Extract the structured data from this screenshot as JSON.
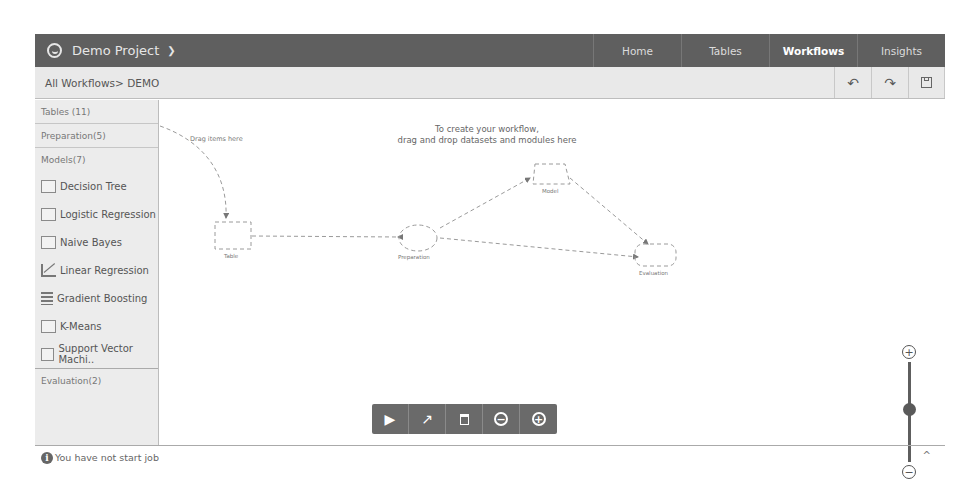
{
  "topbar": {
    "project_name": "Demo Project",
    "nav": [
      {
        "label": "Home",
        "active": false
      },
      {
        "label": "Tables",
        "active": false
      },
      {
        "label": "Workflows",
        "active": true
      },
      {
        "label": "Insights",
        "active": false
      }
    ]
  },
  "breadcrumb": {
    "text": "All Workflows> DEMO",
    "tools": {
      "undo": "↶",
      "redo": "↷",
      "save": "💾"
    }
  },
  "sidebar": {
    "sections": {
      "tables": "Tables (11)",
      "preparation": "Preparation(5)",
      "models": "Models(7)",
      "evaluation": "Evaluation(2)"
    },
    "models": [
      {
        "label": "Decision Tree",
        "icon": "decision-tree-icon"
      },
      {
        "label": "Logistic Regression",
        "icon": "logistic-regression-icon"
      },
      {
        "label": "Naive Bayes",
        "icon": "naive-bayes-icon"
      },
      {
        "label": "Linear Regression",
        "icon": "linear-regression-icon"
      },
      {
        "label": "Gradient Boosting",
        "icon": "gradient-boosting-icon"
      },
      {
        "label": "K-Means",
        "icon": "k-means-icon"
      },
      {
        "label": "Support Vector Machi..",
        "icon": "svm-icon"
      }
    ]
  },
  "canvas": {
    "hint_line1": "To create your workflow,",
    "hint_line2": "drag and drop datasets and modules here",
    "drag_hint": "Drag items here",
    "nodes": {
      "table": "Table",
      "preparation": "Preparation",
      "model": "Model",
      "evaluation": "Evaluation"
    }
  },
  "controls": {
    "play": "▶",
    "connect": "↗",
    "delete": "🗑",
    "zoom_out": "−",
    "zoom_in": "+"
  },
  "zoom_slider": {
    "plus": "+",
    "minus": "−",
    "position_percent": 50
  },
  "status": {
    "message": "You have not start job",
    "info_glyph": "i",
    "caret": "^"
  }
}
